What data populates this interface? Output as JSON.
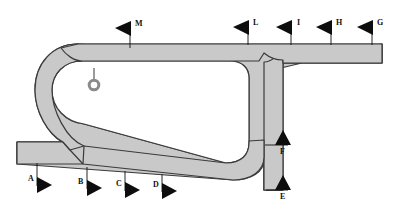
{
  "figure": {
    "band_fill": "#c9c9c9",
    "band_stroke": "#3a3a3a",
    "marker_color": "#0d0d0d",
    "background": "#ffffff",
    "ring_stroke": "#8a8a8a",
    "canvas": {
      "width": 402,
      "height": 217
    }
  },
  "markers": [
    {
      "id": "A",
      "label": "A",
      "direction": "right",
      "label_side": "left",
      "tip_x": 50,
      "tip_y": 185,
      "pole_x": 37,
      "pole_y1": 163,
      "pole_y2": 185,
      "label_x": 28,
      "label_y": 180
    },
    {
      "id": "B",
      "label": "B",
      "direction": "right",
      "label_side": "left",
      "tip_x": 100,
      "tip_y": 188,
      "pole_x": 87,
      "pole_y1": 166,
      "pole_y2": 188,
      "label_x": 78,
      "label_y": 183
    },
    {
      "id": "C",
      "label": "C",
      "direction": "right",
      "label_side": "left",
      "tip_x": 138,
      "tip_y": 190,
      "pole_x": 125,
      "pole_y1": 169,
      "pole_y2": 190,
      "label_x": 116,
      "label_y": 185
    },
    {
      "id": "D",
      "label": "D",
      "direction": "right",
      "label_side": "left",
      "tip_x": 175,
      "tip_y": 191,
      "pole_x": 162,
      "pole_y1": 171,
      "pole_y2": 191,
      "label_x": 153,
      "label_y": 186
    },
    {
      "id": "E",
      "label": "E",
      "direction": "up",
      "label_side": "below",
      "tip_x": 283,
      "tip_y": 184,
      "pole_x": 268,
      "pole_y1": 190,
      "pole_y2": 190,
      "label_x": 279,
      "label_y": 198
    },
    {
      "id": "F",
      "label": "F",
      "direction": "up",
      "label_side": "below",
      "tip_x": 283,
      "tip_y": 134,
      "pole_x": 266,
      "pole_y1": 145,
      "pole_y2": 145,
      "label_x": 279,
      "label_y": 150
    },
    {
      "id": "G",
      "label": "G",
      "direction": "left",
      "label_side": "right",
      "tip_x": 359,
      "tip_y": 27,
      "pole_x": 372,
      "pole_y1": 27,
      "pole_y2": 44,
      "label_x": 376,
      "label_y": 23
    },
    {
      "id": "H",
      "label": "H",
      "direction": "left",
      "label_side": "right",
      "tip_x": 318,
      "tip_y": 27,
      "pole_x": 331,
      "pole_y1": 27,
      "pole_y2": 44,
      "label_x": 335,
      "label_y": 23
    },
    {
      "id": "I",
      "label": "I",
      "direction": "left",
      "label_side": "right",
      "tip_x": 278,
      "tip_y": 27,
      "pole_x": 291,
      "pole_y1": 27,
      "pole_y2": 44,
      "label_x": 296,
      "label_y": 23
    },
    {
      "id": "L",
      "label": "L",
      "direction": "left",
      "label_side": "right",
      "tip_x": 235,
      "tip_y": 27,
      "pole_x": 248,
      "pole_y1": 27,
      "pole_y2": 44,
      "label_x": 252,
      "label_y": 23
    },
    {
      "id": "M",
      "label": "M",
      "direction": "left",
      "label_side": "right",
      "tip_x": 117,
      "tip_y": 28,
      "pole_x": 130,
      "pole_y1": 28,
      "pole_y2": 48,
      "label_x": 134,
      "label_y": 24
    }
  ],
  "ring_marker": {
    "id": "ring",
    "cx": 94,
    "cy": 85,
    "r_outer": 6.2,
    "r_inner": 3.2,
    "stem_x": 94,
    "stem_y1": 68,
    "stem_y2": 79
  },
  "band_outline": {
    "description": "Looped tubular band with a long top arm extending right, a hairpin U-turn on the left, a bottom arm returning right, a short stub arm at lower-left, and a vertical descending branch at the right junction."
  }
}
